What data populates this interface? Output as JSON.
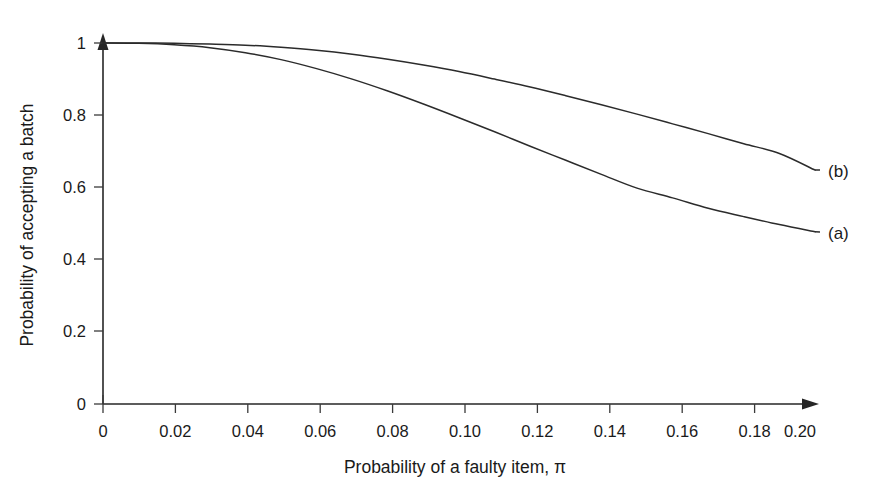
{
  "chart_data": {
    "type": "line",
    "title": "",
    "xlabel": "Probability of a faulty item, π",
    "ylabel": "Probability of accepting a batch",
    "xlim": [
      0,
      0.2
    ],
    "ylim": [
      0,
      1
    ],
    "grid": false,
    "legend_position": "right-inline",
    "xticks": [
      "0",
      "0.02",
      "0.04",
      "0.06",
      "0.08",
      "0.10",
      "0.12",
      "0.14",
      "0.16",
      "0.18",
      "0.20"
    ],
    "xtick_values": [
      0,
      0.02,
      0.04,
      0.06,
      0.08,
      0.1,
      0.12,
      0.14,
      0.16,
      0.18,
      0.2
    ],
    "yticks": [
      "0",
      "0.2",
      "0.4",
      "0.6",
      "0.8",
      "1"
    ],
    "ytick_values": [
      0,
      0.2,
      0.4,
      0.6,
      0.8,
      1
    ],
    "x": [
      0,
      0.01,
      0.02,
      0.03,
      0.04,
      0.05,
      0.06,
      0.07,
      0.08,
      0.09,
      0.1,
      0.11,
      0.12,
      0.13,
      0.14,
      0.15,
      0.16,
      0.17,
      0.18,
      0.19,
      0.2
    ],
    "series": [
      {
        "name": "(a)",
        "label": "(a)",
        "values": [
          1.0,
          0.999,
          0.995,
          0.987,
          0.973,
          0.954,
          0.929,
          0.9,
          0.867,
          0.831,
          0.793,
          0.754,
          0.714,
          0.675,
          0.636,
          0.598,
          0.571,
          0.542,
          0.519,
          0.497,
          0.477
        ]
      },
      {
        "name": "(b)",
        "label": "(b)",
        "values": [
          1.0,
          1.0,
          0.999,
          0.997,
          0.994,
          0.988,
          0.98,
          0.969,
          0.955,
          0.939,
          0.921,
          0.9,
          0.878,
          0.854,
          0.829,
          0.803,
          0.776,
          0.749,
          0.721,
          0.694,
          0.648
        ]
      }
    ],
    "colors": {
      "curve": "#2b2b2b",
      "axis": "#262626",
      "text": "#1a1a1a",
      "background": "#ffffff"
    },
    "axis_arrows": {
      "x_axis_arrow": true,
      "y_axis_arrow": true
    }
  }
}
